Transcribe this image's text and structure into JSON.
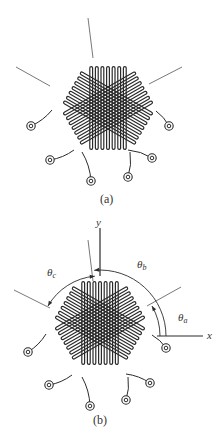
{
  "figures": [
    {
      "id": "a",
      "caption": "(a)",
      "center": [
        108,
        108
      ],
      "caption_pos": [
        100,
        203
      ],
      "gauge_axes_deg": [
        30,
        90,
        150
      ],
      "reference_lines": [
        {
          "from": [
            88,
            18
          ],
          "to": [
            93,
            58
          ]
        },
        {
          "from": [
            16,
            67
          ],
          "to": [
            50,
            86
          ]
        },
        {
          "from": [
            182,
            67
          ],
          "to": [
            149,
            84
          ]
        }
      ],
      "terminals": [
        [
          31,
          126
        ],
        [
          169,
          126
        ],
        [
          50,
          160
        ],
        [
          152,
          158
        ],
        [
          91,
          181
        ],
        [
          128,
          177
        ]
      ],
      "leads": [
        {
          "from": [
            52,
            110
          ],
          "to": [
            31,
            126
          ]
        },
        {
          "from": [
            156,
            111
          ],
          "to": [
            169,
            126
          ]
        },
        {
          "from": [
            74,
            150
          ],
          "to": [
            50,
            160
          ]
        },
        {
          "from": [
            128,
            150
          ],
          "to": [
            152,
            158
          ]
        },
        {
          "from": [
            82,
            152
          ],
          "to": [
            91,
            181
          ]
        },
        {
          "from": [
            130,
            152
          ],
          "to": [
            128,
            177
          ]
        }
      ]
    },
    {
      "id": "b",
      "caption": "(b)",
      "center": [
        100,
        323
      ],
      "caption_pos": [
        93,
        424
      ],
      "gauge_axes_deg": [
        30,
        90,
        150
      ],
      "reference_lines": [
        {
          "from": [
            88,
            240
          ],
          "to": [
            93,
            281
          ]
        },
        {
          "from": [
            14,
            290
          ],
          "to": [
            50,
            308
          ]
        },
        {
          "from": [
            181,
            287
          ],
          "to": [
            147,
            306
          ]
        }
      ],
      "terminals": [
        [
          28,
          352
        ],
        [
          166,
          348
        ],
        [
          49,
          385
        ],
        [
          150,
          383
        ],
        [
          90,
          406
        ],
        [
          126,
          400
        ]
      ],
      "leads": [
        {
          "from": [
            46,
            334
          ],
          "to": [
            28,
            352
          ]
        },
        {
          "from": [
            152,
            335
          ],
          "to": [
            166,
            348
          ]
        },
        {
          "from": [
            72,
            375
          ],
          "to": [
            49,
            385
          ]
        },
        {
          "from": [
            126,
            374
          ],
          "to": [
            150,
            383
          ]
        },
        {
          "from": [
            82,
            377
          ],
          "to": [
            90,
            406
          ]
        },
        {
          "from": [
            128,
            377
          ],
          "to": [
            126,
            400
          ]
        }
      ],
      "axes": {
        "y_label": "y",
        "x_label": "x",
        "y_axis": {
          "from": [
            100,
            228
          ],
          "to": [
            100,
            276
          ]
        },
        "x_axis": {
          "from": [
            157,
            336
          ],
          "to": [
            203,
            336
          ]
        },
        "y_label_pos": [
          96,
          226
        ],
        "x_label_pos": [
          207,
          339
        ]
      },
      "angles": [
        {
          "symbol": "θ",
          "subscript": "a",
          "label_pos": [
            178,
            321
          ],
          "radius": 60,
          "from_deg": 0,
          "to_deg": 30
        },
        {
          "symbol": "θ",
          "subscript": "b",
          "label_pos": [
            137,
            268
          ],
          "radius": 66,
          "from_deg": 0,
          "to_deg": 95
        },
        {
          "symbol": "θ",
          "subscript": "c",
          "label_pos": [
            47,
            276
          ],
          "radius": 60,
          "from_deg": 95,
          "to_deg": 150
        }
      ]
    }
  ],
  "colors": {
    "ink": "#2b2b2b",
    "ink_light": "#555555",
    "background": "#ffffff"
  }
}
